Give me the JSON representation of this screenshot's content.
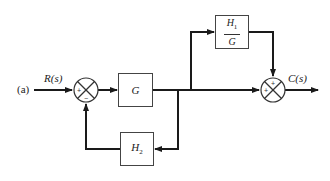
{
  "diagram": {
    "part_label": "(a)",
    "input_label": "R(s)",
    "output_label": "C(s)",
    "blocks": {
      "forward": "G",
      "feedforward_num": "H",
      "feedforward_num_sub": "1",
      "feedforward_den": "G",
      "feedback": "H",
      "feedback_sub": "2"
    },
    "summing_junctions": [
      {
        "id": "sum1",
        "signs": [
          "+",
          "-"
        ]
      },
      {
        "id": "sum2",
        "signs": [
          "+",
          "+"
        ]
      }
    ],
    "colors": {
      "line": "#1a1a1a",
      "block_border": "#444444"
    }
  }
}
